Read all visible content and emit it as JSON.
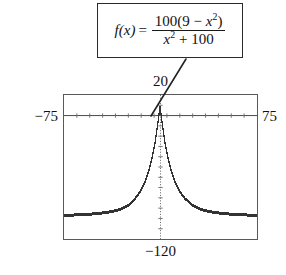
{
  "figure": {
    "name": "graphing-calculator-figure",
    "formula": {
      "lhs": "f(x)",
      "equals": "=",
      "numerator_prefix": "100(9 − ",
      "numerator_var": "x",
      "numerator_exp": "2",
      "numerator_suffix": ")",
      "denominator_var": "x",
      "denominator_exp": "2",
      "denominator_suffix": " + 100",
      "plain": "f(x) = 100(9 − x²) / (x² + 100)"
    },
    "window": {
      "xmin_label": "−75",
      "xmax_label": "75",
      "ymax_label": "20",
      "ymin_label": "−120"
    }
  },
  "chart_data": {
    "type": "line",
    "title": "",
    "subtitle": "",
    "xlabel": "",
    "ylabel": "",
    "expression": "f(x) = 100(9 - x^2)/(x^2 + 100)",
    "xlim": [
      -75,
      75
    ],
    "ylim": [
      -120,
      20
    ],
    "grid": false,
    "legend": null,
    "axis_style": "dotted-tick-marks",
    "x_tick_spacing": 10,
    "y_tick_spacing": 10,
    "render_style": "pixelated-dot-plot",
    "annotations": [
      {
        "text": "20",
        "position": "above-plot-center",
        "role": "y-max"
      },
      {
        "text": "−120",
        "position": "below-plot-center",
        "role": "y-min"
      },
      {
        "text": "−75",
        "position": "left-of-plot",
        "role": "x-min"
      },
      {
        "text": "75",
        "position": "right-of-plot",
        "role": "x-max"
      },
      {
        "text": "f(x) = 100(9 − x²)/(x² + 100)",
        "position": "callout-box-top",
        "role": "function-label",
        "leader_from": [
          185,
          60
        ],
        "leader_to": [
          152,
          115
        ]
      }
    ],
    "features": {
      "y_intercept": 9,
      "x_intercepts": [
        -3,
        3
      ],
      "horizontal_asymptote": -100,
      "maximum": {
        "x": 0,
        "y": 9
      }
    },
    "series": [
      {
        "name": "f(x)",
        "color": "#333333",
        "x": [
          -75,
          -70,
          -65,
          -60,
          -55,
          -50,
          -45,
          -40,
          -35,
          -30,
          -25,
          -20,
          -18,
          -16,
          -14,
          -12,
          -10,
          -9,
          -8,
          -7,
          -6,
          -5,
          -4,
          -3,
          -2,
          -1,
          0,
          1,
          2,
          3,
          4,
          5,
          6,
          7,
          8,
          9,
          10,
          12,
          14,
          16,
          18,
          20,
          25,
          30,
          35,
          40,
          45,
          50,
          55,
          60,
          65,
          70,
          75
        ],
        "y": [
          -96.5,
          -96.3,
          -96.1,
          -95.8,
          -95.4,
          -94.9,
          -94.2,
          -93.3,
          -92.1,
          -90.0,
          -86.8,
          -81.2,
          -78.1,
          -74.5,
          -70.1,
          -64.8,
          -58.2,
          -54.3,
          -50.0,
          -45.0,
          -39.7,
          -33.6,
          -26.7,
          -18.9,
          -10.0,
          0.0,
          9.0,
          0.0,
          -10.0,
          -18.9,
          -26.7,
          -33.6,
          -39.7,
          -45.0,
          -50.0,
          -54.3,
          -58.2,
          -64.8,
          -70.1,
          -74.5,
          -78.1,
          -81.2,
          -86.8,
          -90.0,
          -92.1,
          -93.3,
          -94.2,
          -94.9,
          -95.4,
          -95.8,
          -96.1,
          -96.3,
          -96.5
        ]
      }
    ]
  }
}
